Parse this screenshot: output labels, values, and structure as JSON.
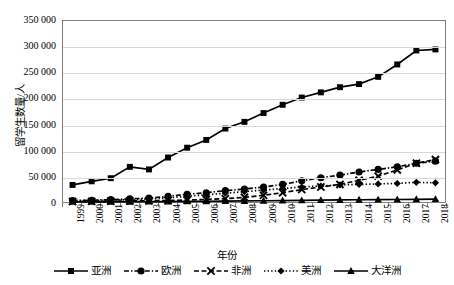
{
  "chart_data": {
    "type": "line",
    "title": "",
    "xlabel": "年份",
    "ylabel": "留学生数量/人",
    "ylim": [
      0,
      350000
    ],
    "ytick_labels": [
      "350 000",
      "300 000",
      "250 000",
      "200 000",
      "150 000",
      "100 000",
      "50 000",
      "0"
    ],
    "ytick_values": [
      350000,
      300000,
      250000,
      200000,
      150000,
      100000,
      50000,
      0
    ],
    "grid": true,
    "legend_position": "bottom",
    "x": [
      1999,
      2000,
      2001,
      2002,
      2003,
      2004,
      2005,
      2006,
      2007,
      2008,
      2009,
      2010,
      2011,
      2012,
      2013,
      2014,
      2015,
      2016,
      2017,
      2018
    ],
    "categories": [
      "1999",
      "2000",
      "2001",
      "2002",
      "2003",
      "2004",
      "2005",
      "2006",
      "2007",
      "2008",
      "2009",
      "2010",
      "2011",
      "2012",
      "2013",
      "2014",
      "2015",
      "2016",
      "2017",
      "2018"
    ],
    "series": [
      {
        "name": "亚洲",
        "marker": "square",
        "line_style": "solid",
        "color": "#000000",
        "values": [
          33000,
          40000,
          46000,
          68000,
          63000,
          86000,
          105000,
          120000,
          142000,
          155000,
          172000,
          188000,
          202000,
          212000,
          222000,
          228000,
          242000,
          266000,
          293000,
          295000
        ]
      },
      {
        "name": "欧洲",
        "marker": "circle",
        "line_style": "dash-dot",
        "color": "#000000",
        "values": [
          3000,
          3500,
          4500,
          6000,
          7500,
          11000,
          15000,
          18000,
          22000,
          25000,
          29000,
          34000,
          41000,
          47000,
          52000,
          58000,
          63000,
          68000,
          75000,
          79000
        ]
      },
      {
        "name": "非洲",
        "marker": "x",
        "line_style": "dashed",
        "color": "#000000",
        "values": [
          1000,
          1200,
          1500,
          2000,
          2600,
          3000,
          3800,
          5000,
          6500,
          9000,
          13000,
          18000,
          24000,
          29000,
          34000,
          42000,
          50000,
          62000,
          75000,
          82000
        ]
      },
      {
        "name": "美洲",
        "marker": "diamond",
        "line_style": "dotted",
        "color": "#000000",
        "values": [
          2500,
          3000,
          3500,
          4500,
          6000,
          8000,
          11000,
          14000,
          17000,
          20000,
          23000,
          26000,
          29000,
          31000,
          33000,
          34000,
          35000,
          36000,
          38000,
          37000
        ]
      },
      {
        "name": "大洋洲",
        "marker": "triangle",
        "line_style": "solid",
        "color": "#000000",
        "values": [
          300,
          350,
          400,
          500,
          700,
          900,
          1200,
          1500,
          1800,
          2100,
          2400,
          2800,
          3200,
          3600,
          4000,
          4300,
          4600,
          4900,
          5200,
          5500
        ]
      }
    ]
  }
}
